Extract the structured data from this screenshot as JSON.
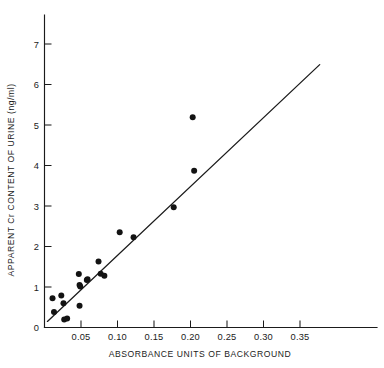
{
  "chart_data": {
    "type": "scatter",
    "title": "",
    "xlabel": "ABSORBANCE  UNITS OF BACKGROUND",
    "ylabel": "APPARENT Cr CONTENT OF URINE (ng/ml)",
    "xlim": [
      0.0,
      0.39
    ],
    "ylim": [
      0.0,
      7.6
    ],
    "xticks": [
      0.05,
      0.1,
      0.15,
      0.2,
      0.25,
      0.3,
      0.35
    ],
    "xticklabels": [
      "0.05",
      "0.10",
      "0.15",
      "0.20",
      "0.25",
      "0.30",
      "0.35"
    ],
    "yticks": [
      0,
      1,
      2,
      3,
      4,
      5,
      6,
      7
    ],
    "yticklabels": [
      "0",
      "1",
      "2",
      "3",
      "4",
      "5",
      "6",
      "7"
    ],
    "grid": false,
    "legend": null,
    "marker": {
      "shape": "filled-circle",
      "color": "#131313",
      "radius_px": 3.0
    },
    "points": [
      {
        "x": 0.011,
        "y": 0.72
      },
      {
        "x": 0.013,
        "y": 0.38
      },
      {
        "x": 0.023,
        "y": 0.79
      },
      {
        "x": 0.026,
        "y": 0.6
      },
      {
        "x": 0.027,
        "y": 0.2
      },
      {
        "x": 0.031,
        "y": 0.22
      },
      {
        "x": 0.047,
        "y": 1.32
      },
      {
        "x": 0.048,
        "y": 1.05
      },
      {
        "x": 0.049,
        "y": 1.01
      },
      {
        "x": 0.048,
        "y": 0.54
      },
      {
        "x": 0.058,
        "y": 1.17
      },
      {
        "x": 0.059,
        "y": 1.19
      },
      {
        "x": 0.074,
        "y": 1.63
      },
      {
        "x": 0.077,
        "y": 1.33
      },
      {
        "x": 0.082,
        "y": 1.28
      },
      {
        "x": 0.103,
        "y": 2.35
      },
      {
        "x": 0.122,
        "y": 2.23
      },
      {
        "x": 0.177,
        "y": 2.97
      },
      {
        "x": 0.203,
        "y": 5.19
      },
      {
        "x": 0.205,
        "y": 3.87
      }
    ],
    "fit_line": {
      "type": "linear-regression",
      "x_start": 0.004,
      "y_start": 0.15,
      "x_end": 0.377,
      "y_end": 6.49
    }
  },
  "figure": {
    "background_color": "#ffffff",
    "ink_color": "#1b1b1b"
  }
}
